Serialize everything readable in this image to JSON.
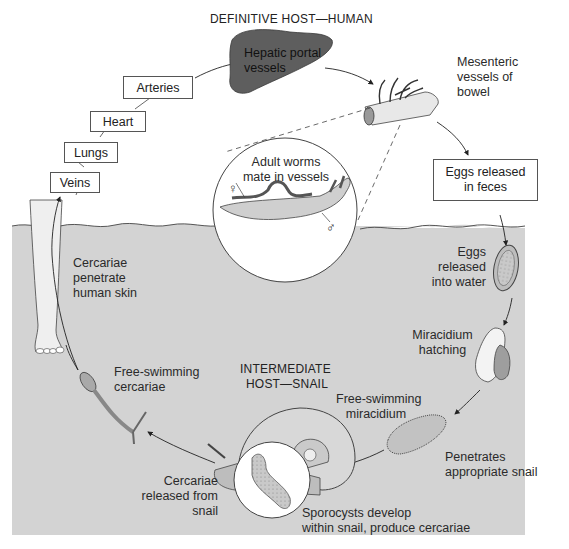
{
  "diagram": {
    "type": "life-cycle",
    "titles": {
      "definitive_host": "DEFINITIVE HOST—HUMAN",
      "intermediate_host_line1": "INTERMEDIATE",
      "intermediate_host_line2": "HOST—SNAIL"
    },
    "boxes": {
      "veins": "Veins",
      "lungs": "Lungs",
      "heart": "Heart",
      "arteries": "Arteries",
      "eggs_feces_line1": "Eggs released",
      "eggs_feces_line2": "in feces"
    },
    "labels": {
      "hepatic_line1": "Hepatic portal",
      "hepatic_line2": "vessels",
      "mesenteric_line1": "Mesenteric",
      "mesenteric_line2": "vessels of",
      "mesenteric_line3": "bowel",
      "adult_line1": "Adult worms",
      "adult_line2": "mate in vessels",
      "female_symbol": "♀",
      "male_symbol": "♂",
      "eggs_water_line1": "Eggs",
      "eggs_water_line2": "released",
      "eggs_water_line3": "into water",
      "miracidium_hatch_line1": "Miracidium",
      "miracidium_hatch_line2": "hatching",
      "free_miracidium_line1": "Free-swimming",
      "free_miracidium_line2": "miracidium",
      "penetrates_line1": "Penetrates",
      "penetrates_line2": "appropriate snail",
      "sporocysts_line1": "Sporocysts develop",
      "sporocysts_line2": "within snail, produce cercariae",
      "released_line1": "Cercariae",
      "released_line2": "released from",
      "released_line3": "snail",
      "free_cercariae_line1": "Free-swimming",
      "free_cercariae_line2": "cercariae",
      "penetrate_skin_line1": "Cercariae",
      "penetrate_skin_line2": "penetrate",
      "penetrate_skin_line3": "human skin"
    },
    "cycle_sequence": [
      "Cercariae penetrate human skin",
      "Veins",
      "Lungs",
      "Heart",
      "Arteries",
      "Hepatic portal vessels",
      "Mesenteric vessels of bowel",
      "Eggs released in feces",
      "Eggs released into water",
      "Miracidium hatching",
      "Free-swimming miracidium",
      "Penetrates appropriate snail",
      "Sporocysts develop within snail, produce cercariae",
      "Cercariae released from snail",
      "Free-swimming cercariae"
    ],
    "colors": {
      "water": "#d3d3d3",
      "liver": "#5e5e5e",
      "line": "#333333"
    }
  }
}
